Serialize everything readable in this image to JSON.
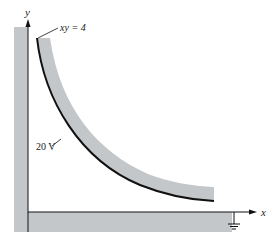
{
  "figure": {
    "labels": {
      "y_axis": "y",
      "x_axis": "x",
      "curve_equation": "xy = 4",
      "potential": "20 V"
    },
    "colors": {
      "conductor_fill": "#c4c7c9",
      "line": "#111111",
      "background": "#ffffff"
    },
    "elements": [
      "grounded L-shaped conductor along x and y axes",
      "hyperbolic conductor surface xy = 4 at 20 V",
      "ground symbol on x-axis conductor"
    ]
  }
}
